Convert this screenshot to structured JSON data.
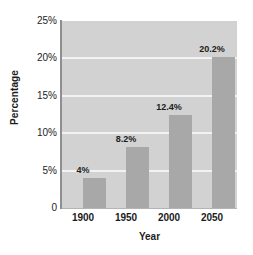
{
  "figure": {
    "title_sliver": "",
    "plot_background": "#d2d2d2",
    "bar_color": "#a8a8a8",
    "gridline_color": "#f2f2f2",
    "axis_color": "#8f8f8f"
  },
  "chart_data": {
    "type": "bar",
    "title": "",
    "xlabel": "Year",
    "ylabel": "Percentage",
    "categories": [
      "1900",
      "1950",
      "2000",
      "2050"
    ],
    "values": [
      4,
      8.2,
      12.4,
      20.2
    ],
    "data_labels": [
      "4%",
      "8.2%",
      "12.4%",
      "20.2%"
    ],
    "ylim": [
      0,
      25
    ],
    "yticks": [
      0,
      5,
      10,
      15,
      20,
      25
    ],
    "ytick_labels": [
      "0",
      "5%",
      "10%",
      "15%",
      "20%",
      "25%"
    ],
    "grid": true,
    "grid_axis": "y",
    "legend": null,
    "legend_position": "none"
  }
}
